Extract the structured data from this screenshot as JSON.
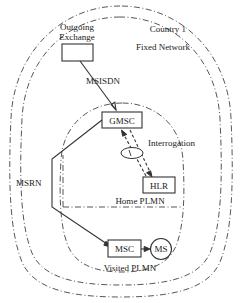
{
  "diagram": {
    "regions": [
      {
        "id": "country",
        "label": "Country 1"
      },
      {
        "id": "fixed_network",
        "label": "Fixed Network"
      },
      {
        "id": "home_plmn",
        "label": "Home PLMN"
      },
      {
        "id": "visited_plmn",
        "label": "Visited PLMN"
      }
    ],
    "nodes": [
      {
        "id": "outgoing_exchange",
        "label": "Outgoing",
        "label2": "Exchange",
        "shape": "rect"
      },
      {
        "id": "gmsc",
        "label": "GMSC",
        "shape": "rect"
      },
      {
        "id": "hlr",
        "label": "HLR",
        "shape": "rect"
      },
      {
        "id": "msc",
        "label": "MSC",
        "shape": "rect"
      },
      {
        "id": "ms",
        "label": "MS",
        "shape": "circle"
      }
    ],
    "edges": [
      {
        "id": "msisdn",
        "label": "MSISDN",
        "from": "outgoing_exchange",
        "to": "gmsc",
        "style": "solid"
      },
      {
        "id": "interrogation",
        "label": "Interrogation",
        "from": "gmsc",
        "to": "hlr",
        "style": "dashed"
      },
      {
        "id": "msrn",
        "label": "MSRN",
        "from": "gmsc",
        "to": "msc",
        "style": "solid"
      },
      {
        "id": "msc_ms",
        "label": "",
        "from": "msc",
        "to": "ms",
        "style": "solid"
      }
    ],
    "colors": {
      "stroke": "#333333",
      "boundary": "#444444",
      "background": "#ffffff",
      "text": "#1a1a1a"
    }
  }
}
